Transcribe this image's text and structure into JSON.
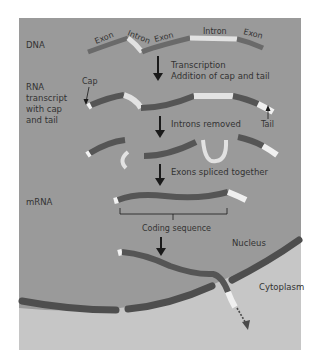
{
  "diagram": {
    "colors": {
      "background": "#ffffff",
      "nucleus": "#9a9a9a",
      "cytoplasm": "#c6c6c6",
      "exon": "#555555",
      "intron": "#e2e2e2",
      "cap": "#f2f2f2",
      "tail": "#f0f0f0",
      "membrane": "#4e4e4e",
      "text": "#333333",
      "arrow": "#1a1a1a"
    },
    "row_labels": {
      "dna": "DNA",
      "rna_line1": "RNA",
      "rna_line2": "transcript",
      "rna_line3": "with cap",
      "rna_line4": "and tail",
      "mrna": "mRNA"
    },
    "segment_labels": {
      "exon1": "Exon",
      "intron1": "Intron",
      "exon2": "Exon",
      "intron2": "Intron",
      "exon3": "Exon"
    },
    "steps": {
      "step1_line1": "Transcription",
      "step1_line2": "Addition of cap and tail",
      "step2": "Introns removed",
      "step3": "Exons spliced together"
    },
    "annotations": {
      "cap": "Cap",
      "tail": "Tail",
      "coding_sequence": "Coding sequence",
      "nucleus": "Nucleus",
      "cytoplasm": "Cytoplasm"
    }
  }
}
